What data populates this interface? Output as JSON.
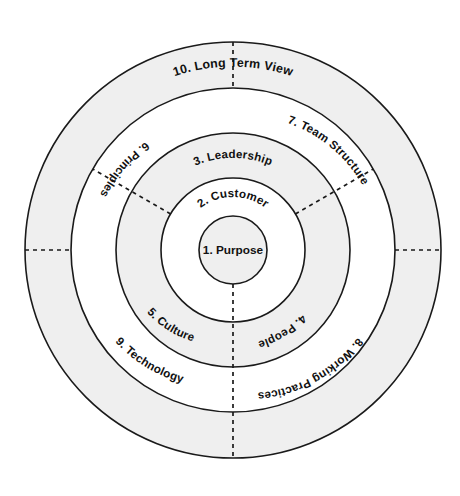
{
  "diagram": {
    "center": {
      "x": 233,
      "y": 250
    },
    "colors": {
      "stroke": "#1a1a1a",
      "shaded_ring_fill": "#efefef",
      "plain_ring_fill": "#ffffff",
      "text": "#111111",
      "background": "#ffffff"
    },
    "rings": [
      {
        "index": 1,
        "name": "core",
        "radius": 34,
        "fill": "plain",
        "label_style": "horizontal"
      },
      {
        "index": 2,
        "name": "inner-ring",
        "radius": 72,
        "fill": "plain",
        "label_style": "curved"
      },
      {
        "index": 3,
        "name": "middle-ring",
        "radius": 117,
        "fill": "plain",
        "label_style": "curved"
      },
      {
        "index": 4,
        "name": "outer-middle-ring",
        "radius": 162,
        "fill": "shaded",
        "label_style": "curved"
      },
      {
        "index": 5,
        "name": "outer-ring",
        "radius": 208,
        "fill": "shaded",
        "label_style": "curved"
      }
    ],
    "labels": {
      "core": "1. Purpose",
      "ring2_top": "2. Customer",
      "ring3_top": "3. Leadership",
      "ring3_right": "4. People",
      "ring3_left": "5. Culture",
      "ring4_upper_left": "6. Principles",
      "ring4_upper_right": "7. Team Structure",
      "ring4_lower_right": "8. Working Practices",
      "ring4_lower_left": "9. Technology",
      "ring5_top": "10. Long Term View"
    },
    "segments": [
      {
        "id": 1,
        "label": "1. Purpose",
        "ring": "core",
        "position": "center"
      },
      {
        "id": 2,
        "label": "2. Customer",
        "ring": "inner-ring",
        "position": "top"
      },
      {
        "id": 3,
        "label": "3. Leadership",
        "ring": "middle-ring",
        "position": "top"
      },
      {
        "id": 4,
        "label": "4. People",
        "ring": "middle-ring",
        "position": "lower-right"
      },
      {
        "id": 5,
        "label": "5. Culture",
        "ring": "middle-ring",
        "position": "lower-left"
      },
      {
        "id": 6,
        "label": "6. Principles",
        "ring": "outer-middle-ring",
        "position": "upper-left"
      },
      {
        "id": 7,
        "label": "7. Team Structure",
        "ring": "outer-middle-ring",
        "position": "upper-right"
      },
      {
        "id": 8,
        "label": "8. Working Practices",
        "ring": "outer-middle-ring",
        "position": "lower-right"
      },
      {
        "id": 9,
        "label": "9. Technology",
        "ring": "outer-middle-ring",
        "position": "lower-left"
      },
      {
        "id": 10,
        "label": "10. Long Term View",
        "ring": "outer-ring",
        "position": "top"
      }
    ],
    "dividers": {
      "style": "dashed",
      "angles_degrees": [
        90,
        210,
        330
      ],
      "description": "Radial dashed lines at bottom, upper-left and upper-right separating the ring segments"
    }
  }
}
